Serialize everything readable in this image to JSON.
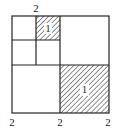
{
  "diagram": {
    "top_label": "2",
    "bottom_labels": [
      "2",
      "2",
      "2"
    ],
    "shaded_small_label": "1",
    "shaded_large_label": "1",
    "line_color": "#222222",
    "hatch_color": "#333333"
  }
}
